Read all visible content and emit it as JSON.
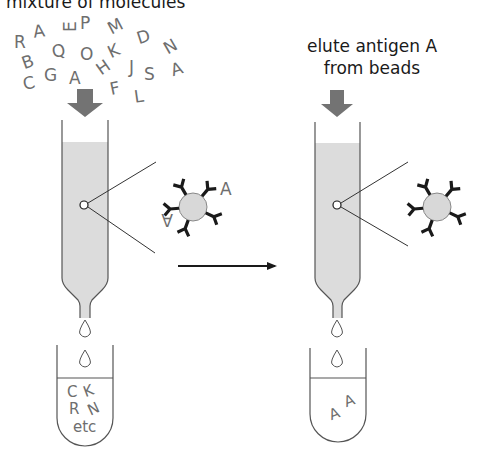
{
  "title": "mixture of molecules",
  "right_label": {
    "line1": "elute antigen A",
    "line2": "from beads"
  },
  "molecules": [
    {
      "ch": "R",
      "x": 14,
      "y": 48,
      "r": 0
    },
    {
      "ch": "A",
      "x": 33,
      "y": 37,
      "r": -8
    },
    {
      "ch": "E",
      "x": 65,
      "y": 33,
      "r": -90
    },
    {
      "ch": "P",
      "x": 80,
      "y": 29,
      "r": 0
    },
    {
      "ch": "M",
      "x": 108,
      "y": 33,
      "r": -28
    },
    {
      "ch": "D",
      "x": 137,
      "y": 43,
      "r": -18
    },
    {
      "ch": "N",
      "x": 164,
      "y": 53,
      "r": -30
    },
    {
      "ch": "B",
      "x": 22,
      "y": 68,
      "r": -20
    },
    {
      "ch": "Q",
      "x": 52,
      "y": 57,
      "r": -12
    },
    {
      "ch": "O",
      "x": 80,
      "y": 60,
      "r": 0
    },
    {
      "ch": "K",
      "x": 108,
      "y": 57,
      "r": -25
    },
    {
      "ch": "C",
      "x": 23,
      "y": 89,
      "r": -12
    },
    {
      "ch": "G",
      "x": 44,
      "y": 81,
      "r": 0
    },
    {
      "ch": "A",
      "x": 69,
      "y": 84,
      "r": 0
    },
    {
      "ch": "H",
      "x": 97,
      "y": 74,
      "r": -35
    },
    {
      "ch": "J",
      "x": 129,
      "y": 73,
      "r": 0
    },
    {
      "ch": "S",
      "x": 144,
      "y": 80,
      "r": 0
    },
    {
      "ch": "A",
      "x": 171,
      "y": 75,
      "r": -18
    },
    {
      "ch": "F",
      "x": 110,
      "y": 94,
      "r": -12
    },
    {
      "ch": "L",
      "x": 134,
      "y": 102,
      "r": -8
    }
  ],
  "left_tube_contents": {
    "line1_a": "C",
    "line1_b": "K",
    "line2_a": "R",
    "line2_b": "N",
    "line3": "etc"
  },
  "bound_antigen_label": "A",
  "right_tube_contents": [
    "A",
    "A"
  ],
  "colors": {
    "arrow_fill": "#737373",
    "column_fill": "#dcdcdc",
    "outline": "#555555",
    "antibody": "#1a1a1a",
    "bead_fill": "#d8d8d8",
    "molecule_text": "#6e6e6e"
  }
}
